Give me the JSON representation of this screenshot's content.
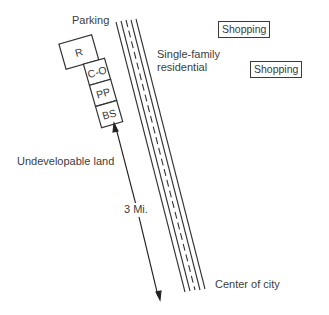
{
  "diagram": {
    "labels": {
      "parking": "Parking",
      "residential_line1": "Single-family",
      "residential_line2": "residential",
      "undevelopable": "Undevelopable land",
      "distance": "3 Mi.",
      "center": "Center of city"
    },
    "stores": [
      "R",
      "C-O",
      "PP",
      "BS"
    ],
    "shopping_boxes": [
      "Shopping",
      "Shopping"
    ],
    "highway": {
      "lanes": 4,
      "style": "solid outer, dashed center"
    }
  }
}
